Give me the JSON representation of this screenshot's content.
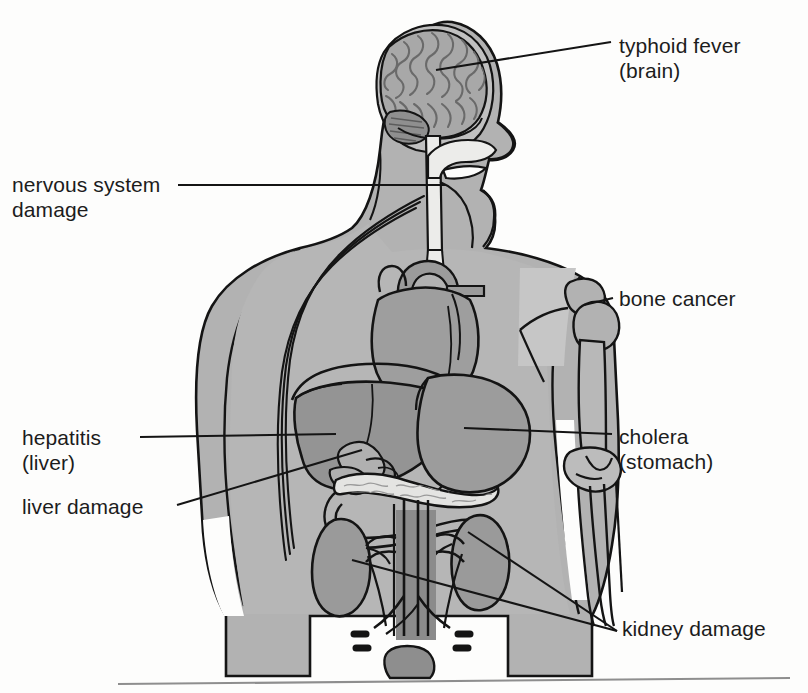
{
  "figure": {
    "background_color": "#fdfdfc",
    "body_fill": "#b2b2b2",
    "organ_fill": "#9a9a9a",
    "organ_fill_dark": "#8c8c8c",
    "highlight_fill": "#c4c4c4",
    "pale_fill": "#e8e8e6",
    "outline_color": "#141414"
  },
  "labels": [
    {
      "id": "typhoid",
      "name": "typhoid-fever-brain",
      "line1": "typhoid fever",
      "line2": "(brain)",
      "text": "typhoid fever\n(brain)",
      "side": "right"
    },
    {
      "id": "nervous",
      "name": "nervous-system-damage",
      "line1": "nervous system",
      "line2": "damage",
      "text": "nervous system\ndamage",
      "side": "left"
    },
    {
      "id": "bone",
      "name": "bone-cancer",
      "line1": "bone cancer",
      "line2": "",
      "text": "bone cancer",
      "side": "right"
    },
    {
      "id": "cholera",
      "name": "cholera-stomach",
      "line1": "cholera",
      "line2": "(stomach)",
      "text": "cholera\n(stomach)",
      "side": "right"
    },
    {
      "id": "hepatitis",
      "name": "hepatitis-liver",
      "line1": "hepatitis",
      "line2": "(liver)",
      "text": "hepatitis\n(liver)",
      "side": "left"
    },
    {
      "id": "liverdmg",
      "name": "liver-damage",
      "line1": "liver damage",
      "line2": "",
      "text": "liver damage",
      "side": "left"
    },
    {
      "id": "kidney",
      "name": "kidney-damage",
      "line1": "kidney damage",
      "line2": "",
      "text": "kidney damage",
      "side": "right"
    }
  ],
  "organs": [
    {
      "name": "brain",
      "label_ref": "typhoid"
    },
    {
      "name": "spinal-cord",
      "label_ref": "nervous"
    },
    {
      "name": "nerves-arm",
      "label_ref": "nervous"
    },
    {
      "name": "humerus-bone",
      "label_ref": "bone"
    },
    {
      "name": "stomach",
      "label_ref": "cholera"
    },
    {
      "name": "liver",
      "label_ref": "hepatitis"
    },
    {
      "name": "liver-2",
      "label_ref": "liverdmg"
    },
    {
      "name": "kidney-left",
      "label_ref": "kidney"
    },
    {
      "name": "kidney-right",
      "label_ref": "kidney"
    },
    {
      "name": "heart",
      "label_ref": ""
    },
    {
      "name": "pancreas",
      "label_ref": ""
    },
    {
      "name": "gallbladder",
      "label_ref": ""
    },
    {
      "name": "duodenum",
      "label_ref": ""
    },
    {
      "name": "aorta",
      "label_ref": ""
    },
    {
      "name": "elbow-joint",
      "label_ref": ""
    }
  ]
}
